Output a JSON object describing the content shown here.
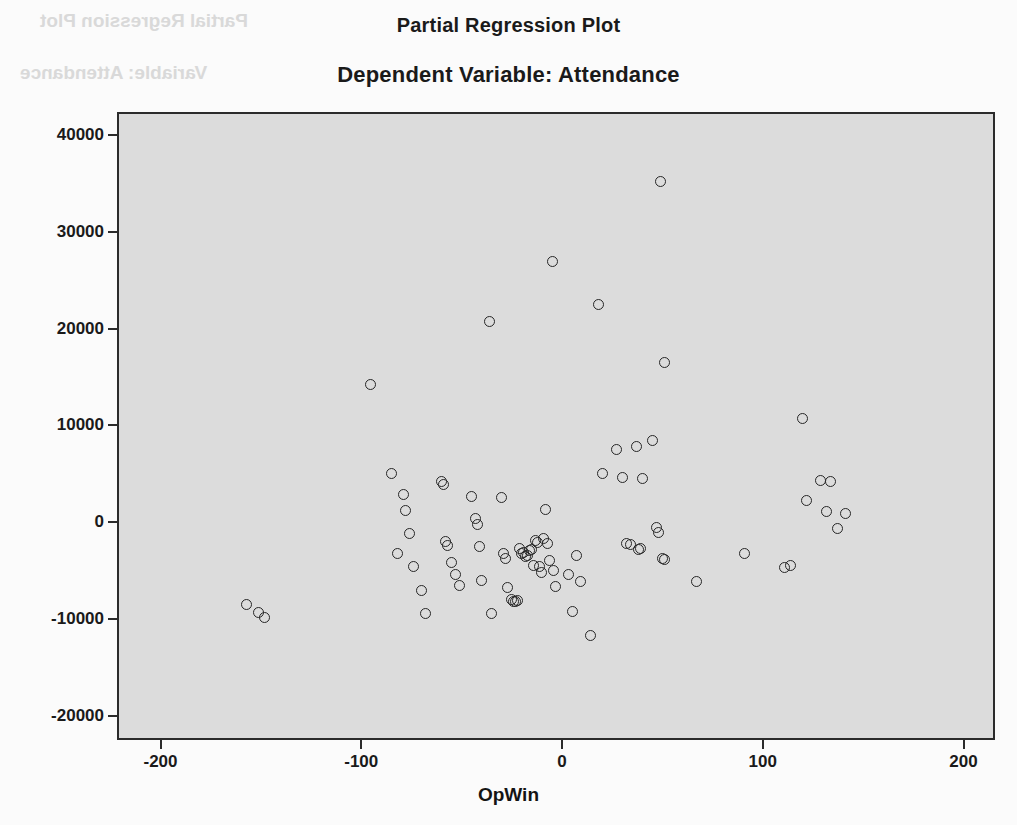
{
  "titles": {
    "main": "Partial Regression Plot",
    "sub": "Dependent Variable: Attendance"
  },
  "ghost_text": {
    "line1": "Partial Regression Plot",
    "line2": "Variable: Attendance"
  },
  "axes": {
    "x_title": "OpWin",
    "y_title": "Attendance",
    "x_ticks": [
      "-200",
      "-100",
      "0",
      "100",
      "200"
    ],
    "y_ticks": [
      "40000",
      "30000",
      "20000",
      "10000",
      "0",
      "-10000",
      "-20000"
    ]
  },
  "chart_data": {
    "type": "scatter",
    "title": "Partial Regression Plot",
    "subtitle": "Dependent Variable: Attendance",
    "xlabel": "OpWin",
    "ylabel": "Attendance",
    "xlim": [
      -220,
      215
    ],
    "ylim": [
      -23000,
      41500
    ],
    "xticks": [
      -200,
      -100,
      0,
      100,
      200
    ],
    "yticks": [
      -20000,
      -10000,
      0,
      10000,
      20000,
      30000,
      40000
    ],
    "grid": false,
    "legend": null,
    "marker": "open-circle",
    "series": [
      {
        "name": "Attendance vs OpWin (partial residuals)",
        "points": [
          [
            -158,
            -8300
          ],
          [
            -152,
            -9100
          ],
          [
            -149,
            -9700
          ],
          [
            -96.6,
            14400
          ],
          [
            -86,
            5200
          ],
          [
            -83,
            -3100
          ],
          [
            -80,
            3000
          ],
          [
            -79,
            1400
          ],
          [
            -77,
            -1000
          ],
          [
            -75,
            -4400
          ],
          [
            -71,
            -6900
          ],
          [
            -69,
            -9300
          ],
          [
            -61,
            4400
          ],
          [
            -60,
            4100
          ],
          [
            -59,
            -1800
          ],
          [
            -58,
            -2200
          ],
          [
            -56,
            -4000
          ],
          [
            -54,
            -5200
          ],
          [
            -52,
            -6400
          ],
          [
            -46,
            2800
          ],
          [
            -44,
            600
          ],
          [
            -43,
            0
          ],
          [
            -42,
            -2300
          ],
          [
            -41,
            -5800
          ],
          [
            -37,
            20900
          ],
          [
            -36,
            -9300
          ],
          [
            -31,
            2700
          ],
          [
            -30,
            -3000
          ],
          [
            -29,
            -3600
          ],
          [
            -28,
            -6600
          ],
          [
            -26,
            -7800
          ],
          [
            -25,
            -8000
          ],
          [
            -24,
            -8000
          ],
          [
            -23,
            -7900
          ],
          [
            -22,
            -2500
          ],
          [
            -21,
            -3100
          ],
          [
            -20,
            -2900
          ],
          [
            -19,
            -3400
          ],
          [
            -18,
            -3300
          ],
          [
            -17,
            -2700
          ],
          [
            -16,
            -2600
          ],
          [
            -15,
            -4300
          ],
          [
            -14,
            -1700
          ],
          [
            -13,
            -1900
          ],
          [
            -12,
            -4400
          ],
          [
            -11,
            -5000
          ],
          [
            -10,
            -1500
          ],
          [
            -9,
            1500
          ],
          [
            -8,
            -2000
          ],
          [
            -7,
            -3800
          ],
          [
            -5.5,
            27100
          ],
          [
            -5,
            -4800
          ],
          [
            -4,
            -6500
          ],
          [
            2,
            -5200
          ],
          [
            4,
            -9000
          ],
          [
            6,
            -3300
          ],
          [
            8,
            -5900
          ],
          [
            13,
            -11500
          ],
          [
            17,
            22700
          ],
          [
            19,
            5200
          ],
          [
            26,
            7700
          ],
          [
            29,
            4800
          ],
          [
            31,
            -2000
          ],
          [
            33,
            -2100
          ],
          [
            36,
            8000
          ],
          [
            37,
            -2600
          ],
          [
            38,
            -2500
          ],
          [
            39,
            4700
          ],
          [
            44,
            8600
          ],
          [
            46,
            -400
          ],
          [
            47,
            -900
          ],
          [
            48,
            35400
          ],
          [
            49,
            -3600
          ],
          [
            50,
            16700
          ],
          [
            50,
            -3700
          ],
          [
            66,
            -5900
          ],
          [
            90,
            -3000
          ],
          [
            110,
            -4500
          ],
          [
            113,
            -4300
          ],
          [
            119,
            10900
          ],
          [
            121,
            2400
          ],
          [
            128,
            4500
          ],
          [
            131,
            1300
          ],
          [
            133,
            4400
          ],
          [
            136,
            -500
          ],
          [
            140,
            1100
          ]
        ]
      }
    ]
  }
}
